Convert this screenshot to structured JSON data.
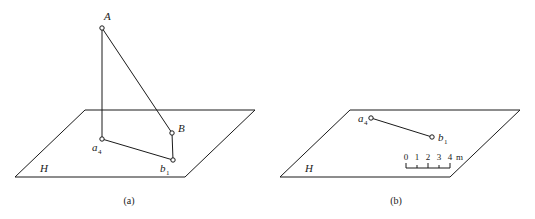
{
  "figure": {
    "background": "#ffffff",
    "line_color": "#1a1a1a",
    "panels": [
      {
        "caption": "(a)",
        "plane_label": "H",
        "points": [
          {
            "id": "A",
            "base": "A",
            "sub": ""
          },
          {
            "id": "B",
            "base": "B",
            "sub": ""
          },
          {
            "id": "a4",
            "base": "a",
            "sub": "4"
          },
          {
            "id": "b1",
            "base": "b",
            "sub": "1"
          }
        ]
      },
      {
        "caption": "(b)",
        "plane_label": "H",
        "points": [
          {
            "id": "a4",
            "base": "a",
            "sub": "4"
          },
          {
            "id": "b1",
            "base": "b",
            "sub": "1"
          }
        ],
        "scale_bar": {
          "ticks": [
            "0",
            "1",
            "2",
            "3",
            "4"
          ],
          "unit": "m"
        }
      }
    ]
  },
  "panel_a": {
    "caption": "(a)",
    "plane_label": "H",
    "label_A": "A",
    "label_B": "B",
    "label_a_base": "a",
    "label_a_sub": "4",
    "label_b_base": "b",
    "label_b_sub": "1"
  },
  "panel_b": {
    "caption": "(b)",
    "plane_label": "H",
    "label_a_base": "a",
    "label_a_sub": "4",
    "label_b_base": "b",
    "label_b_sub": "1",
    "scale_0": "0",
    "scale_1": "1",
    "scale_2": "2",
    "scale_3": "3",
    "scale_4": "4",
    "scale_unit": "m"
  }
}
